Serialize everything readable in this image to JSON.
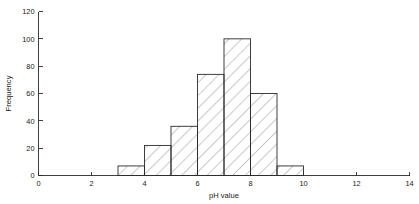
{
  "chart_data": {
    "type": "bar",
    "title": "",
    "subtitle": "",
    "xlabel": "pH value",
    "ylabel": "Frequency",
    "xlim": [
      0,
      14
    ],
    "ylim": [
      0,
      120
    ],
    "grid": false,
    "legend": null,
    "legend_position": "none",
    "bin_width": 1,
    "bin_edges": [
      3,
      4,
      5,
      6,
      7,
      8,
      9,
      10
    ],
    "categories": [
      "3-4",
      "4-5",
      "5-6",
      "6-7",
      "7-8",
      "8-9",
      "9-10"
    ],
    "values": [
      7,
      22,
      36,
      74,
      100,
      60,
      7
    ],
    "bars": [
      {
        "x0": 3,
        "x1": 4,
        "value": 7
      },
      {
        "x0": 4,
        "x1": 5,
        "value": 22
      },
      {
        "x0": 5,
        "x1": 6,
        "value": 36
      },
      {
        "x0": 6,
        "x1": 7,
        "value": 74
      },
      {
        "x0": 7,
        "x1": 8,
        "value": 100
      },
      {
        "x0": 8,
        "x1": 9,
        "value": 60
      },
      {
        "x0": 9,
        "x1": 10,
        "value": 7
      }
    ],
    "x_ticks": [
      0,
      2,
      4,
      6,
      8,
      10,
      12,
      14
    ],
    "x_tick_labels": [
      "0",
      "2",
      "4",
      "6",
      "8",
      "10",
      "12",
      "14"
    ],
    "y_ticks": [
      0,
      20,
      40,
      60,
      80,
      100,
      120
    ],
    "y_tick_labels": [
      "0",
      "20",
      "40",
      "60",
      "80",
      "100",
      "120"
    ],
    "fill_style": "diagonal-hatch",
    "colors": {
      "axis": "#2b2b2b",
      "bar_outline": "#2b2b2b",
      "hatch": "#3a3a3a",
      "background": "#ffffff",
      "text": "#1a1a1a"
    }
  }
}
